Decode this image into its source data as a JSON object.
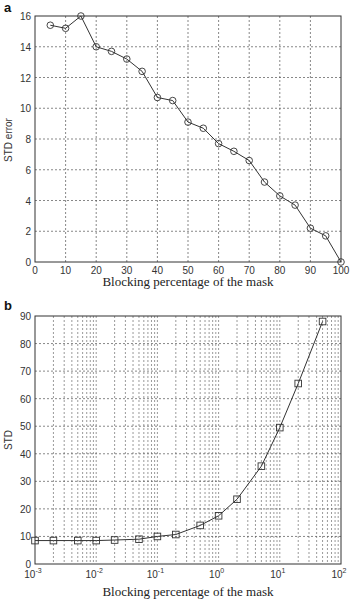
{
  "chart_data": [
    {
      "panel": "a",
      "type": "line",
      "title": "",
      "xlabel": "Blocking percentage of the mask",
      "ylabel": "STD error",
      "xlim": [
        0,
        100
      ],
      "ylim": [
        0,
        16
      ],
      "xticks": [
        0,
        10,
        20,
        30,
        40,
        50,
        60,
        70,
        80,
        90,
        100
      ],
      "yticks": [
        0,
        2,
        4,
        6,
        8,
        10,
        12,
        14,
        16
      ],
      "grid": true,
      "marker": "circle",
      "x": [
        5,
        10,
        15,
        20,
        25,
        30,
        35,
        40,
        45,
        50,
        55,
        60,
        65,
        70,
        75,
        80,
        85,
        90,
        95,
        100
      ],
      "values": [
        15.4,
        15.2,
        16.0,
        14.0,
        13.7,
        13.2,
        12.4,
        10.7,
        10.5,
        9.1,
        8.7,
        7.7,
        7.2,
        6.6,
        5.2,
        4.3,
        3.7,
        2.2,
        1.7,
        0.0
      ]
    },
    {
      "panel": "b",
      "type": "line",
      "title": "",
      "xlabel": "Blocking percentage of the mask",
      "ylabel": "STD",
      "xscale": "log",
      "xlim": [
        0.001,
        100
      ],
      "ylim": [
        0,
        90
      ],
      "xticks": [
        "10^-3",
        "10^-2",
        "10^-1",
        "10^0",
        "10^1",
        "10^2"
      ],
      "yticks": [
        0,
        10,
        20,
        30,
        40,
        50,
        60,
        70,
        80,
        90
      ],
      "grid": true,
      "marker": "square",
      "x": [
        0.001,
        0.002,
        0.005,
        0.01,
        0.02,
        0.05,
        0.1,
        0.2,
        0.5,
        1,
        2,
        5,
        10,
        20,
        50
      ],
      "values": [
        8.5,
        8.5,
        8.5,
        8.5,
        8.7,
        9.0,
        10.0,
        10.7,
        14.0,
        17.5,
        23.5,
        35.5,
        49.5,
        65.5,
        88.0
      ]
    }
  ],
  "labels": {
    "panel_a": "a",
    "panel_b": "b",
    "a_xlabel": "Blocking percentage of the mask",
    "a_ylabel": "STD error",
    "b_xlabel": "Blocking percentage of the mask",
    "b_ylabel": "STD"
  }
}
